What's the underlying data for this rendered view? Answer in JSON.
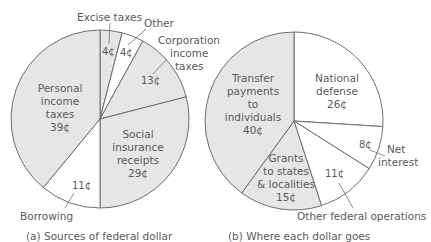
{
  "chart_data": [
    {
      "type": "pie",
      "title": "(a) Sources of federal dollar",
      "unit": "¢",
      "slices": [
        {
          "label": "Excise taxes",
          "value": 4,
          "value_label": "4¢",
          "shaded": true
        },
        {
          "label": "Other",
          "value": 4,
          "value_label": "4¢",
          "shaded": false
        },
        {
          "label": "Corporation income taxes",
          "value": 13,
          "value_label": "13¢",
          "shaded": true
        },
        {
          "label": "Social insurance receipts",
          "value": 29,
          "value_label": "29¢",
          "shaded": true
        },
        {
          "label": "Borrowing",
          "value": 11,
          "value_label": "11¢",
          "shaded": false
        },
        {
          "label": "Personal income taxes",
          "value": 39,
          "value_label": "39¢",
          "shaded": true
        }
      ]
    },
    {
      "type": "pie",
      "title": "(b) Where each dollar goes",
      "unit": "¢",
      "slices": [
        {
          "label": "National defense",
          "value": 26,
          "value_label": "26¢",
          "shaded": false
        },
        {
          "label": "Net interest",
          "value": 8,
          "value_label": "8¢",
          "shaded": false
        },
        {
          "label": "Other federal operations",
          "value": 11,
          "value_label": "11¢",
          "shaded": false
        },
        {
          "label": "Grants to states & localities",
          "value": 15,
          "value_label": "15¢",
          "shaded": true
        },
        {
          "label": "Transfer payments to individuals",
          "value": 40,
          "value_label": "40¢",
          "shaded": true
        }
      ]
    }
  ],
  "colors": {
    "shaded": "#e6e6e6",
    "unshaded": "#ffffff",
    "stroke": "#6e6e6e",
    "text": "#5a5a5a"
  },
  "labels": {
    "a": {
      "excise": "Excise taxes",
      "other": "Other",
      "corp": [
        "Corporation",
        "income",
        "taxes"
      ],
      "personal": [
        "Personal",
        "income",
        "taxes",
        "39¢"
      ],
      "social": [
        "Social",
        "insurance",
        "receipts",
        "29¢"
      ],
      "borrowing": "Borrowing",
      "v_excise": "4¢",
      "v_other": "4¢",
      "v_corp": "13¢",
      "v_borrow": "11¢",
      "caption": "(a)  Sources of federal dollar"
    },
    "b": {
      "transfer": [
        "Transfer",
        "payments",
        "to",
        "individuals",
        "40¢"
      ],
      "defense": [
        "National",
        "defense",
        "26¢"
      ],
      "v_interest": "8¢",
      "interest": [
        "Net",
        "interest"
      ],
      "grants": [
        "Grants",
        "to states",
        "& localities",
        "15¢"
      ],
      "v_other": "11¢",
      "other": "Other federal operations",
      "caption": "(b)  Where each dollar goes"
    }
  }
}
